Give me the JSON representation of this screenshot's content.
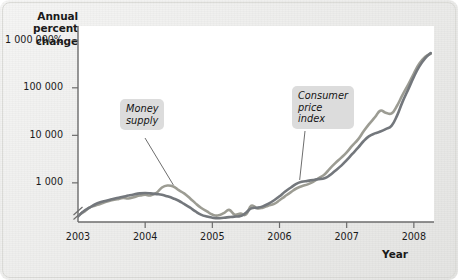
{
  "figure": {
    "background_color": "#e9e9e7",
    "plot_background_color": "#ffffff"
  },
  "axes": {
    "y_title": "Annual\npercent\nchange",
    "x_title": "Year",
    "y_ticks": [
      {
        "label": "1 000 000%",
        "value": 1000000
      },
      {
        "label": "100 000",
        "value": 100000
      },
      {
        "label": "10 000",
        "value": 10000
      },
      {
        "label": "1 000",
        "value": 1000
      }
    ],
    "x_ticks": [
      "2003",
      "2004",
      "2005",
      "2006",
      "2007",
      "2008"
    ],
    "y_axis_break": "true",
    "axis_color": "#6b6b6b"
  },
  "annotations": [
    {
      "name": "money-supply",
      "text": "Money\nsupply",
      "color": "#dcdcdc"
    },
    {
      "name": "consumer-price-index",
      "text": "Consumer\nprice\nindex",
      "color": "#dcdcdc"
    }
  ],
  "chart_data": {
    "type": "line",
    "title": "",
    "subtitle": "",
    "xlabel": "Year",
    "ylabel": "Annual percent change",
    "yscale": "log",
    "ylim": [
      150,
      2000000
    ],
    "xlim": [
      2003.0,
      2008.3
    ],
    "ytick_values": [
      1000,
      10000,
      100000,
      1000000
    ],
    "ytick_labels": [
      "1 000",
      "10 000",
      "100 000",
      "1 000 000%"
    ],
    "xtick_values": [
      2003,
      2004,
      2005,
      2006,
      2007,
      2008
    ],
    "grid": false,
    "legend": "inline-annotations",
    "annotations": [
      {
        "label": "Money supply",
        "points_to_x": 2004.42,
        "points_to_y": 900
      },
      {
        "label": "Consumer price index",
        "points_to_x": 2006.3,
        "points_to_y": 1150
      }
    ],
    "series": [
      {
        "name": "Money supply",
        "color": "#9c9c93",
        "x": [
          2003.0,
          2003.08,
          2003.17,
          2003.25,
          2003.33,
          2003.42,
          2003.5,
          2003.58,
          2003.67,
          2003.75,
          2003.83,
          2003.92,
          2004.0,
          2004.08,
          2004.17,
          2004.25,
          2004.33,
          2004.42,
          2004.5,
          2004.58,
          2004.67,
          2004.75,
          2004.83,
          2004.92,
          2005.0,
          2005.08,
          2005.17,
          2005.25,
          2005.33,
          2005.42,
          2005.5,
          2005.58,
          2005.67,
          2005.75,
          2005.83,
          2005.92,
          2006.0,
          2006.08,
          2006.17,
          2006.25,
          2006.33,
          2006.42,
          2006.5,
          2006.58,
          2006.67,
          2006.75,
          2006.83,
          2006.92,
          2007.0,
          2007.08,
          2007.17,
          2007.25,
          2007.33,
          2007.42,
          2007.5,
          2007.58,
          2007.67,
          2007.75,
          2007.83,
          2007.92,
          2008.0,
          2008.08,
          2008.17,
          2008.25
        ],
        "y": [
          205,
          240,
          300,
          330,
          360,
          400,
          430,
          450,
          480,
          470,
          500,
          540,
          560,
          545,
          620,
          800,
          880,
          840,
          700,
          600,
          470,
          370,
          300,
          250,
          215,
          205,
          230,
          270,
          215,
          225,
          215,
          330,
          290,
          300,
          330,
          360,
          430,
          520,
          640,
          760,
          850,
          930,
          1050,
          1250,
          1500,
          2000,
          2600,
          3400,
          4400,
          6000,
          8200,
          12000,
          17000,
          24000,
          33000,
          30000,
          29000,
          42000,
          70000,
          120000,
          200000,
          320000,
          450000,
          520000
        ]
      },
      {
        "name": "Consumer price index",
        "color": "#73777c",
        "x": [
          2003.0,
          2003.08,
          2003.17,
          2003.25,
          2003.33,
          2003.42,
          2003.5,
          2003.58,
          2003.67,
          2003.75,
          2003.83,
          2003.92,
          2004.0,
          2004.08,
          2004.17,
          2004.25,
          2004.33,
          2004.42,
          2004.5,
          2004.58,
          2004.67,
          2004.75,
          2004.83,
          2004.92,
          2005.0,
          2005.08,
          2005.17,
          2005.25,
          2005.33,
          2005.42,
          2005.5,
          2005.58,
          2005.67,
          2005.75,
          2005.83,
          2005.92,
          2006.0,
          2006.08,
          2006.17,
          2006.25,
          2006.33,
          2006.42,
          2006.5,
          2006.58,
          2006.67,
          2006.75,
          2006.83,
          2006.92,
          2007.0,
          2007.08,
          2007.17,
          2007.25,
          2007.33,
          2007.42,
          2007.5,
          2007.58,
          2007.67,
          2007.75,
          2007.83,
          2007.92,
          2008.0,
          2008.08,
          2008.17,
          2008.25
        ],
        "y": [
          195,
          250,
          300,
          350,
          390,
          420,
          450,
          480,
          510,
          540,
          570,
          600,
          610,
          600,
          580,
          560,
          520,
          470,
          420,
          360,
          300,
          250,
          215,
          195,
          185,
          180,
          185,
          190,
          195,
          200,
          235,
          290,
          300,
          320,
          360,
          430,
          520,
          650,
          800,
          950,
          1050,
          1100,
          1150,
          1200,
          1250,
          1450,
          1800,
          2300,
          3000,
          4000,
          5500,
          7500,
          9500,
          11000,
          12000,
          13500,
          16000,
          26000,
          50000,
          95000,
          170000,
          280000,
          420000,
          540000
        ]
      }
    ]
  }
}
